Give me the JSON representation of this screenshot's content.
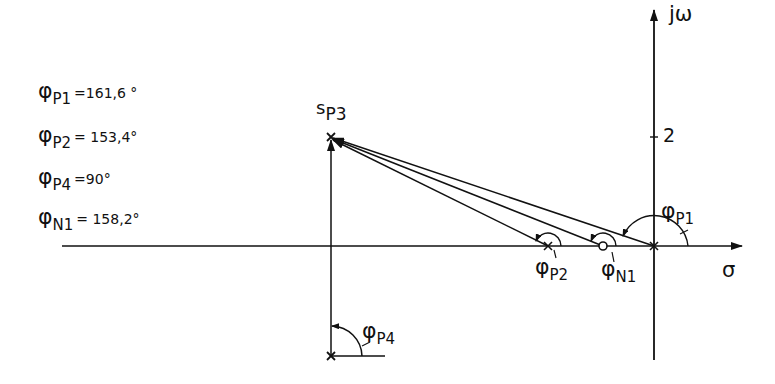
{
  "diagram": {
    "type": "pole-zero-plot",
    "axes": {
      "real_label": "σ",
      "imag_label": "jω",
      "imag_tick": "2"
    },
    "points": {
      "sP3": {
        "symbol": "s",
        "sub": "P3"
      },
      "P2": {
        "kind": "pole"
      },
      "N1": {
        "kind": "zero"
      },
      "P1": {
        "kind": "pole"
      },
      "P4": {
        "kind": "pole"
      }
    },
    "angle_labels": [
      {
        "id": "P1",
        "phi": "φ",
        "sub": "P1"
      },
      {
        "id": "P2",
        "phi": "φ",
        "sub": "P2"
      },
      {
        "id": "N1",
        "phi": "φ",
        "sub": "N1"
      },
      {
        "id": "P4",
        "phi": "φ",
        "sub": "P4"
      }
    ],
    "legend": [
      {
        "phi": "φ",
        "sub": "P1",
        "value": "=161,6 °"
      },
      {
        "phi": "φ",
        "sub": "P2",
        "value": "= 153,4°"
      },
      {
        "phi": "φ",
        "sub": "P4",
        "value": "=90°"
      },
      {
        "phi": "φ",
        "sub": "N1",
        "value": "= 158,2°"
      }
    ]
  }
}
